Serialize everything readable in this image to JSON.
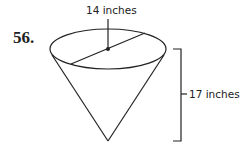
{
  "problem": {
    "number": "56."
  },
  "figure": {
    "shape": "cone",
    "diameter_label": "14 inches",
    "height_label": "17 inches"
  }
}
